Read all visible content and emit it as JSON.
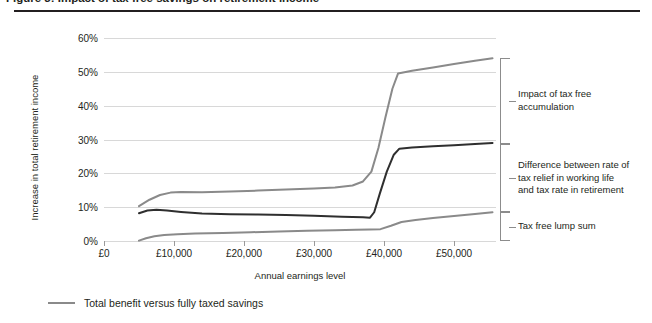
{
  "figure": {
    "title": "Figure 3: Impact of tax free savings on retirement income",
    "legend": {
      "swatch_color": "#8a8a8a",
      "label": "Total benefit versus fully taxed savings"
    },
    "annotations": [
      {
        "key": "accumulation",
        "text": "Impact of tax free\naccumulation",
        "from_pct": 54,
        "to_pct": 28.8
      },
      {
        "key": "rate-difference",
        "text": "Difference between rate of\ntax relief in working life\nand tax rate in retirement",
        "from_pct": 28.8,
        "to_pct": 8.5
      },
      {
        "key": "lump-sum",
        "text": "Tax free lump sum",
        "from_pct": 8.5,
        "to_pct": 0
      }
    ]
  },
  "chart_data": {
    "type": "line",
    "title": "Impact of tax free savings on retirement income",
    "xlabel": "Annual earnings level",
    "ylabel": "Increase in total retirement income",
    "xlim": [
      0,
      56000
    ],
    "ylim": [
      0,
      60
    ],
    "xticks": [
      0,
      10000,
      20000,
      30000,
      40000,
      50000
    ],
    "xtick_labels": [
      "£0",
      "£10,000",
      "£20,000",
      "£30,000",
      "£40,000",
      "£50,000"
    ],
    "yticks": [
      0,
      10,
      20,
      30,
      40,
      50,
      60
    ],
    "ytick_labels": [
      "0%",
      "10%",
      "20%",
      "30%",
      "40%",
      "50%",
      "60%"
    ],
    "grid": true,
    "legend_position": "bottom-left",
    "series": [
      {
        "name": "Total benefit versus fully taxed savings",
        "color": "#8a8a8a",
        "width": 2.0,
        "x": [
          5000,
          6500,
          8000,
          9500,
          11000,
          14000,
          18000,
          22000,
          26000,
          30000,
          33000,
          35500,
          37000,
          38200,
          39200,
          40200,
          41200,
          42000,
          44000,
          47000,
          50000,
          53000,
          55500
        ],
        "y": [
          10.3,
          12.2,
          13.6,
          14.3,
          14.5,
          14.4,
          14.6,
          14.9,
          15.2,
          15.5,
          15.8,
          16.4,
          17.6,
          20.5,
          27.5,
          36.5,
          45.0,
          49.5,
          50.3,
          51.3,
          52.3,
          53.3,
          54.0
        ]
      },
      {
        "name": "Difference between rate of tax relief in working life and tax rate in retirement",
        "color": "#2f2f2f",
        "width": 2.0,
        "x": [
          5000,
          6200,
          7500,
          9000,
          11000,
          14000,
          18000,
          22000,
          26000,
          30000,
          34000,
          37000,
          38000,
          38600,
          39400,
          40400,
          41400,
          42200,
          44000,
          47000,
          50000,
          53000,
          55500
        ],
        "y": [
          8.2,
          9.0,
          9.2,
          9.0,
          8.6,
          8.1,
          7.9,
          7.8,
          7.7,
          7.5,
          7.2,
          7.0,
          6.9,
          8.5,
          14.0,
          20.5,
          25.5,
          27.3,
          27.6,
          28.0,
          28.3,
          28.7,
          29.0
        ]
      },
      {
        "name": "Tax free lump sum",
        "color": "#8a8a8a",
        "width": 2.0,
        "x": [
          5000,
          6000,
          7200,
          8600,
          10500,
          13000,
          17000,
          21000,
          25000,
          29000,
          33000,
          36000,
          38000,
          39500,
          41000,
          42500,
          44500,
          47000,
          50000,
          53000,
          55500
        ],
        "y": [
          0.1,
          0.8,
          1.4,
          1.8,
          2.0,
          2.2,
          2.4,
          2.6,
          2.8,
          3.0,
          3.2,
          3.3,
          3.4,
          3.5,
          4.5,
          5.6,
          6.2,
          6.8,
          7.4,
          8.0,
          8.5
        ]
      }
    ]
  }
}
